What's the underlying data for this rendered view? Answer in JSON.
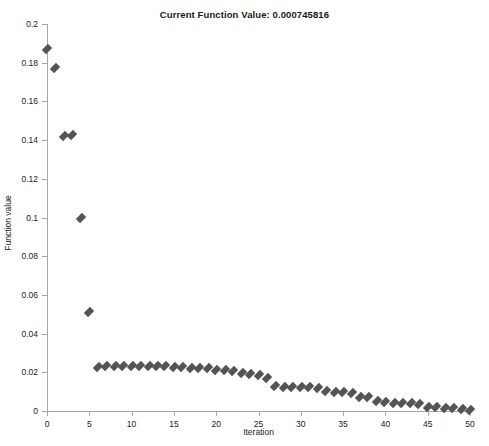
{
  "chart_data": {
    "type": "scatter",
    "title": "Current Function Value: 0.000745816",
    "xlabel": "Iteration",
    "ylabel": "Function value",
    "xlim": [
      0,
      50
    ],
    "ylim": [
      0,
      0.2
    ],
    "xticks": [
      0,
      5,
      10,
      15,
      20,
      25,
      30,
      35,
      40,
      45,
      50
    ],
    "xticklabels": [
      "0",
      "5",
      "10",
      "15",
      "20",
      "25",
      "30",
      "35",
      "40",
      "45",
      "50"
    ],
    "yticks": [
      0,
      0.02,
      0.04,
      0.06,
      0.08,
      0.1,
      0.12,
      0.14,
      0.16,
      0.18,
      0.2
    ],
    "yticklabels": [
      "0",
      "0.02",
      "0.04",
      "0.06",
      "0.08",
      "0.1",
      "0.12",
      "0.14",
      "0.16",
      "0.18",
      "0.2"
    ],
    "grid": false,
    "legend": null,
    "marker": "diamond",
    "marker_color": "#545454",
    "series": [
      {
        "name": "Function value",
        "x": [
          0,
          1,
          2,
          3,
          4,
          5,
          6,
          7,
          8,
          9,
          10,
          11,
          12,
          13,
          14,
          15,
          16,
          17,
          18,
          19,
          20,
          21,
          22,
          23,
          24,
          25,
          26,
          27,
          28,
          29,
          30,
          31,
          32,
          33,
          34,
          35,
          36,
          37,
          38,
          39,
          40,
          41,
          42,
          43,
          44,
          45,
          46,
          47,
          48,
          49,
          50
        ],
        "values": [
          0.187,
          0.1775,
          0.1423,
          0.1425,
          0.0995,
          0.0512,
          0.0228,
          0.023,
          0.0231,
          0.0231,
          0.0232,
          0.0232,
          0.0234,
          0.0233,
          0.0231,
          0.0229,
          0.0226,
          0.0222,
          0.0224,
          0.0222,
          0.0214,
          0.0212,
          0.0206,
          0.0195,
          0.0192,
          0.0185,
          0.0168,
          0.0128,
          0.0124,
          0.0125,
          0.0124,
          0.0124,
          0.012,
          0.0105,
          0.01,
          0.0099,
          0.0095,
          0.0072,
          0.007,
          0.005,
          0.0048,
          0.0042,
          0.0041,
          0.004,
          0.0035,
          0.0022,
          0.002,
          0.0017,
          0.0013,
          0.0011,
          0.0007
        ]
      }
    ]
  },
  "footer": {
    "clipped_text": ""
  }
}
